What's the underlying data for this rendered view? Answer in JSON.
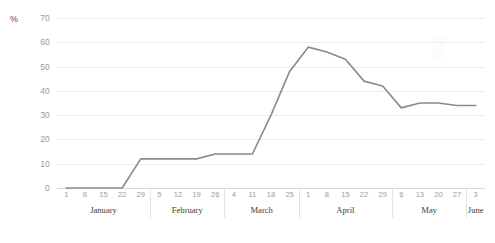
{
  "chart_data": {
    "type": "line",
    "title": "",
    "xlabel": "",
    "ylabel": "%",
    "ylim": [
      0,
      70
    ],
    "ytick_step": 10,
    "yticks": [
      0,
      10,
      20,
      30,
      40,
      50,
      60,
      70
    ],
    "grid": true,
    "legend": null,
    "line_color": "#8a8a8a",
    "categories": [
      "January 1",
      "January 8",
      "January 15",
      "January 22",
      "January 29",
      "February 5",
      "February 12",
      "February 19",
      "February 26",
      "March 4",
      "March 11",
      "March 18",
      "March 25",
      "April 1",
      "April 8",
      "April 15",
      "April 22",
      "April 29",
      "May 6",
      "May 13",
      "May 20",
      "May 27",
      "June 3"
    ],
    "tick_labels": [
      "1",
      "8",
      "15",
      "22",
      "29",
      "5",
      "12",
      "19",
      "26",
      "4",
      "11",
      "18",
      "25",
      "1",
      "8",
      "15",
      "22",
      "29",
      "6",
      "13",
      "20",
      "27",
      "3"
    ],
    "values": [
      0,
      0,
      0,
      0,
      12,
      12,
      12,
      12,
      14,
      14,
      14,
      30,
      48,
      58,
      56,
      53,
      44,
      42,
      33,
      35,
      35,
      34,
      34
    ],
    "months": [
      {
        "name": "January",
        "tick_count": 5
      },
      {
        "name": "February",
        "tick_count": 4
      },
      {
        "name": "March",
        "tick_count": 4
      },
      {
        "name": "April",
        "tick_count": 5
      },
      {
        "name": "May",
        "tick_count": 4
      },
      {
        "name": "June",
        "tick_count": 1
      }
    ]
  }
}
